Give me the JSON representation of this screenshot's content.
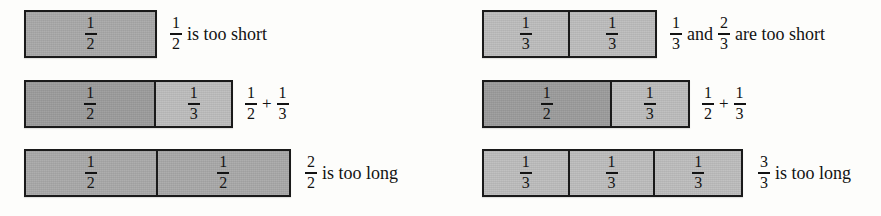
{
  "figure": {
    "colors": {
      "fill_dark": "#9b9b9b",
      "fill_mid": "#a8a8a8",
      "fill_light": "#bcbcbc",
      "stroke": "#1a1a1a",
      "text": "#121212",
      "page": "#fdfdfb"
    }
  },
  "left_panel": {
    "rows": [
      {
        "id": "left-row-1",
        "bar": {
          "x": 24,
          "width": 133,
          "cells": [
            {
              "num": "1",
              "den": "2",
              "shade": "fill-mid",
              "width_pct": 100
            }
          ]
        },
        "caption": {
          "x": 170,
          "parts": [
            {
              "kind": "fraction",
              "num": "1",
              "den": "2"
            },
            {
              "kind": "text",
              "text": "is too short"
            }
          ]
        }
      },
      {
        "id": "left-row-2",
        "bar": {
          "x": 24,
          "width": 209,
          "cells": [
            {
              "num": "1",
              "den": "2",
              "shade": "fill-dark",
              "width_pct": 63.6
            },
            {
              "num": "1",
              "den": "3",
              "shade": "fill-light",
              "width_pct": 36.4
            }
          ]
        },
        "caption": {
          "x": 245,
          "parts": [
            {
              "kind": "fraction",
              "num": "1",
              "den": "2"
            },
            {
              "kind": "op",
              "text": "+"
            },
            {
              "kind": "fraction",
              "num": "1",
              "den": "3"
            }
          ]
        }
      },
      {
        "id": "left-row-3",
        "bar": {
          "x": 24,
          "width": 267,
          "cells": [
            {
              "num": "1",
              "den": "2",
              "shade": "fill-mid",
              "width_pct": 50
            },
            {
              "num": "1",
              "den": "2",
              "shade": "fill-mid",
              "width_pct": 50
            }
          ]
        },
        "caption": {
          "x": 305,
          "parts": [
            {
              "kind": "fraction",
              "num": "2",
              "den": "2"
            },
            {
              "kind": "text",
              "text": "is too long"
            }
          ]
        }
      }
    ]
  },
  "right_panel": {
    "rows": [
      {
        "id": "right-row-1",
        "bar": {
          "x": 42,
          "width": 175,
          "cells": [
            {
              "num": "1",
              "den": "3",
              "shade": "fill-light",
              "width_pct": 50
            },
            {
              "num": "1",
              "den": "3",
              "shade": "fill-light",
              "width_pct": 50
            }
          ]
        },
        "caption": {
          "x": 230,
          "parts": [
            {
              "kind": "fraction",
              "num": "1",
              "den": "3"
            },
            {
              "kind": "text",
              "text": "and"
            },
            {
              "kind": "fraction",
              "num": "2",
              "den": "3"
            },
            {
              "kind": "text",
              "text": "are too short"
            }
          ]
        }
      },
      {
        "id": "right-row-2",
        "bar": {
          "x": 42,
          "width": 208,
          "cells": [
            {
              "num": "1",
              "den": "2",
              "shade": "fill-dark",
              "width_pct": 62.5
            },
            {
              "num": "1",
              "den": "3",
              "shade": "fill-light",
              "width_pct": 37.5
            }
          ]
        },
        "caption": {
          "x": 262,
          "parts": [
            {
              "kind": "fraction",
              "num": "1",
              "den": "2"
            },
            {
              "kind": "op",
              "text": "+"
            },
            {
              "kind": "fraction",
              "num": "1",
              "den": "3"
            }
          ]
        }
      },
      {
        "id": "right-row-3",
        "bar": {
          "x": 42,
          "width": 261,
          "cells": [
            {
              "num": "1",
              "den": "3",
              "shade": "fill-light",
              "width_pct": 33.34
            },
            {
              "num": "1",
              "den": "3",
              "shade": "fill-light",
              "width_pct": 33.33
            },
            {
              "num": "1",
              "den": "3",
              "shade": "fill-light",
              "width_pct": 33.33
            }
          ]
        },
        "caption": {
          "x": 318,
          "parts": [
            {
              "kind": "fraction",
              "num": "3",
              "den": "3"
            },
            {
              "kind": "text",
              "text": "is too long"
            }
          ]
        }
      }
    ]
  }
}
